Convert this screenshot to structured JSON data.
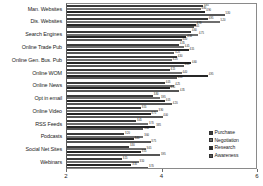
{
  "chart_data": {
    "type": "bar",
    "orientation": "horizontal",
    "grouped": true,
    "title": "",
    "xlabel": "",
    "ylabel": "",
    "xlim": [
      2,
      6
    ],
    "xticks": [
      2,
      4,
      6
    ],
    "xtick_labels": [
      "2",
      "4",
      "6"
    ],
    "grid": false,
    "legend_position": "bottom-right",
    "categories": [
      "Man. Websites",
      "Dis. Websites",
      "Search Engines",
      "Online Trade Pub",
      "Online Gen. Bus. Pub",
      "Online WOM",
      "Online News",
      "Opt in email",
      "Online Video",
      "RSS Feeds",
      "Podcasts",
      "Social Net Sites",
      "Webinars"
    ],
    "series": [
      {
        "name": "Purchase",
        "color": "#3a3a3a",
        "values": [
          4.85,
          4.95,
          4.6,
          4.35,
          4.3,
          4.15,
          4.05,
          3.8,
          3.55,
          3.45,
          3.2,
          3.3,
          3.15
        ]
      },
      {
        "name": "Negotiation",
        "color": "#6e6e6e",
        "values": [
          4.8,
          5.2,
          4.75,
          4.45,
          4.2,
          4.4,
          4.25,
          3.95,
          3.9,
          3.7,
          3.6,
          3.65,
          3.5
        ]
      },
      {
        "name": "Research",
        "color": "#262626",
        "values": [
          4.9,
          4.7,
          4.5,
          4.55,
          4.6,
          4.95,
          4.15,
          4.05,
          3.75,
          3.85,
          3.4,
          3.55,
          3.35
        ]
      },
      {
        "name": "Awareness",
        "color": "#555555",
        "values": [
          5.3,
          4.65,
          4.4,
          4.25,
          4.45,
          4.3,
          4.35,
          4.2,
          4.0,
          3.6,
          3.75,
          3.95,
          3.7
        ]
      }
    ]
  },
  "legend": {
    "items": [
      {
        "label": "Purchase",
        "color": "#3a3a3a"
      },
      {
        "label": "Negotiation",
        "color": "#6e6e6e"
      },
      {
        "label": "Research",
        "color": "#262626"
      },
      {
        "label": "Awareness",
        "color": "#555555"
      }
    ]
  }
}
